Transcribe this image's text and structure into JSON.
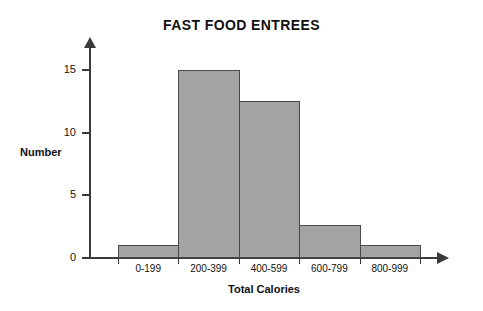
{
  "chart_data": {
    "type": "bar",
    "title": "FAST FOOD ENTREES",
    "xlabel": "Total Calories",
    "ylabel": "Number",
    "categories": [
      "0-199",
      "200-399",
      "400-599",
      "600-799",
      "800-999"
    ],
    "values": [
      1,
      15,
      12.5,
      2.6,
      1
    ],
    "ylim": [
      0,
      16
    ],
    "yticks": [
      0,
      5,
      10,
      15
    ],
    "ytick_labels": [
      "0",
      "5",
      "10",
      "15"
    ],
    "grid": false,
    "legend": null,
    "legend_position": "none",
    "bar_fill_color": "#a3a3a3",
    "bar_edge_color": "#4a4a4a",
    "axis_color": "#3a3a3a",
    "background_color": "#ffffff"
  },
  "axes": {
    "y_arrow": "up-arrow-icon",
    "x_arrow": "right-arrow-icon"
  }
}
